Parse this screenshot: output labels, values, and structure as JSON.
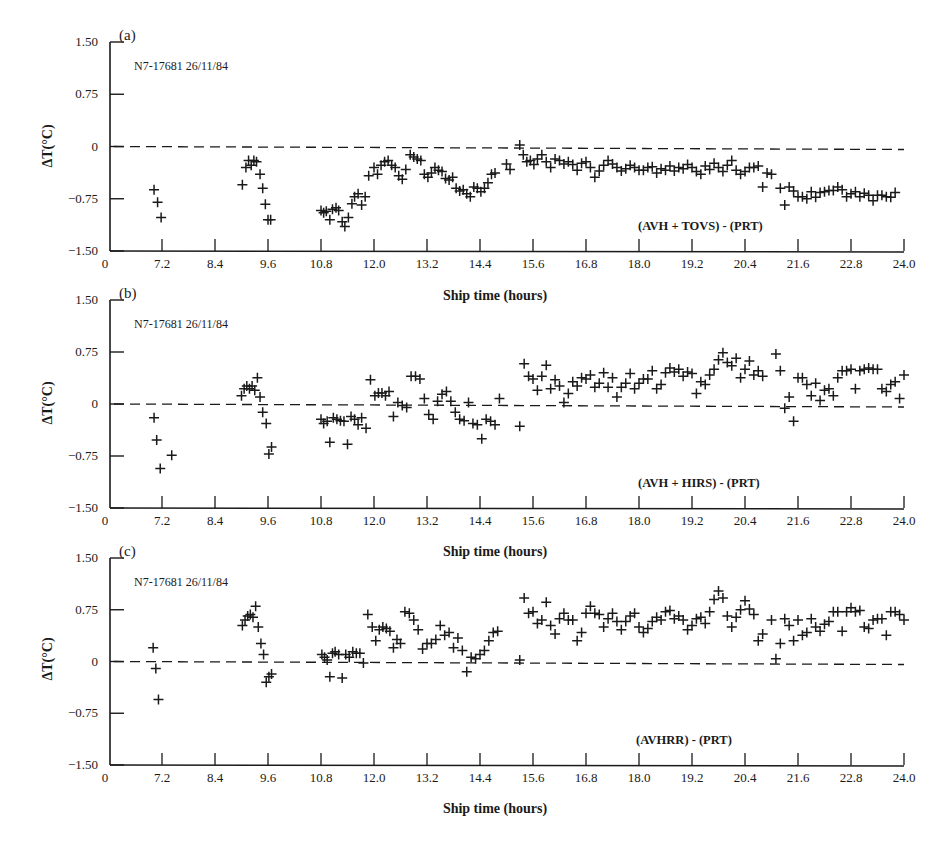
{
  "figure": {
    "xlabel": "Ship time (hours)",
    "ylabel": "ΔT(°C)",
    "x_tick_labels": [
      "0",
      "7.2",
      "8.4",
      "9.6",
      "10.8",
      "12.0",
      "13.2",
      "14.4",
      "15.6",
      "16.8",
      "18.0",
      "19.2",
      "20.4",
      "21.6",
      "22.8",
      "24.0"
    ],
    "y_tick_labels": [
      "1.50",
      "0.75",
      "0",
      "−0.75",
      "−1.50"
    ],
    "marker": "+",
    "zero_line": "dashed",
    "ink_color": "#1a1a1a"
  },
  "chart_data": [
    {
      "type": "scatter",
      "panel": "(a)",
      "run_label": "N7-17681  26/11/84",
      "series_label": "(AVH + TOVS) - (PRT)",
      "xlabel": "Ship time (hours)",
      "ylabel": "ΔT(°C)",
      "xlim": [
        6.0,
        24.0
      ],
      "ylim": [
        -1.5,
        1.5
      ],
      "x_ticks": [
        7.2,
        8.4,
        9.6,
        10.8,
        12.0,
        13.2,
        14.4,
        15.6,
        16.8,
        18.0,
        19.2,
        20.4,
        21.6,
        22.8,
        24.0
      ],
      "y_ticks": [
        1.5,
        0.75,
        0,
        -0.75,
        -1.5
      ],
      "reference_line": 0,
      "grid": false,
      "x": [
        7.02,
        7.1,
        7.18,
        9.02,
        9.1,
        9.16,
        9.22,
        9.28,
        9.34,
        9.42,
        9.48,
        9.54,
        9.6,
        9.66,
        10.8,
        10.86,
        10.92,
        11.0,
        11.06,
        11.14,
        11.2,
        11.28,
        11.34,
        11.42,
        11.5,
        11.56,
        11.64,
        11.72,
        11.8,
        11.88,
        12.0,
        12.08,
        12.16,
        12.24,
        12.32,
        12.4,
        12.48,
        12.56,
        12.64,
        12.72,
        12.82,
        12.9,
        12.98,
        13.06,
        13.14,
        13.22,
        13.3,
        13.38,
        13.46,
        13.54,
        13.62,
        13.7,
        13.78,
        13.86,
        13.94,
        14.02,
        14.1,
        14.18,
        14.26,
        14.34,
        14.42,
        14.5,
        14.58,
        14.66,
        14.74,
        15.0,
        15.08,
        15.3,
        15.38,
        15.46,
        15.54,
        15.62,
        15.7,
        15.8,
        15.9,
        16.0,
        16.1,
        16.2,
        16.3,
        16.4,
        16.5,
        16.6,
        16.7,
        16.8,
        16.9,
        17.0,
        17.1,
        17.2,
        17.3,
        17.4,
        17.5,
        17.6,
        17.7,
        17.8,
        17.9,
        18.0,
        18.1,
        18.2,
        18.3,
        18.4,
        18.5,
        18.6,
        18.7,
        18.8,
        18.9,
        19.0,
        19.1,
        19.2,
        19.3,
        19.4,
        19.5,
        19.6,
        19.7,
        19.8,
        19.9,
        20.0,
        20.1,
        20.2,
        20.3,
        20.4,
        20.5,
        20.6,
        20.7,
        20.8,
        20.9,
        21.0,
        21.2,
        21.3,
        21.4,
        21.5,
        21.6,
        21.7,
        21.8,
        21.9,
        22.0,
        22.1,
        22.2,
        22.3,
        22.4,
        22.5,
        22.6,
        22.7,
        22.8,
        22.9,
        23.0,
        23.1,
        23.2,
        23.3,
        23.4,
        23.5,
        23.6,
        23.7,
        23.8,
        23.9,
        24.0
      ],
      "y": [
        -0.62,
        -0.8,
        -1.02,
        -0.55,
        -0.3,
        -0.2,
        -0.27,
        -0.2,
        -0.22,
        -0.4,
        -0.6,
        -0.83,
        -1.05,
        -1.05,
        -0.92,
        -0.95,
        -0.93,
        -1.05,
        -0.9,
        -0.88,
        -0.92,
        -1.08,
        -1.15,
        -1.02,
        -0.82,
        -0.72,
        -0.68,
        -0.84,
        -0.72,
        -0.42,
        -0.3,
        -0.4,
        -0.27,
        -0.22,
        -0.2,
        -0.27,
        -0.3,
        -0.42,
        -0.47,
        -0.33,
        -0.12,
        -0.15,
        -0.18,
        -0.2,
        -0.4,
        -0.44,
        -0.38,
        -0.3,
        -0.34,
        -0.36,
        -0.46,
        -0.48,
        -0.44,
        -0.6,
        -0.64,
        -0.62,
        -0.68,
        -0.72,
        -0.58,
        -0.6,
        -0.65,
        -0.6,
        -0.52,
        -0.4,
        -0.38,
        -0.25,
        -0.33,
        0.02,
        -0.12,
        -0.22,
        -0.2,
        -0.26,
        -0.18,
        -0.12,
        -0.22,
        -0.3,
        -0.18,
        -0.2,
        -0.25,
        -0.22,
        -0.26,
        -0.34,
        -0.24,
        -0.22,
        -0.3,
        -0.44,
        -0.35,
        -0.27,
        -0.2,
        -0.25,
        -0.3,
        -0.35,
        -0.32,
        -0.27,
        -0.3,
        -0.34,
        -0.34,
        -0.3,
        -0.29,
        -0.38,
        -0.32,
        -0.34,
        -0.28,
        -0.35,
        -0.3,
        -0.32,
        -0.26,
        -0.3,
        -0.36,
        -0.4,
        -0.28,
        -0.33,
        -0.24,
        -0.3,
        -0.36,
        -0.27,
        -0.2,
        -0.34,
        -0.4,
        -0.36,
        -0.3,
        -0.3,
        -0.28,
        -0.58,
        -0.38,
        -0.4,
        -0.6,
        -0.84,
        -0.58,
        -0.64,
        -0.72,
        -0.72,
        -0.75,
        -0.65,
        -0.73,
        -0.66,
        -0.65,
        -0.63,
        -0.63,
        -0.58,
        -0.62,
        -0.72,
        -0.68,
        -0.65,
        -0.72,
        -0.67,
        -0.7,
        -0.78,
        -0.7,
        -0.7,
        -0.72,
        -0.73,
        -0.66
      ]
    },
    {
      "type": "scatter",
      "panel": "(b)",
      "run_label": "N7-17681  26/11/84",
      "series_label": "(AVH + HIRS) - (PRT)",
      "xlabel": "Ship time (hours)",
      "ylabel": "ΔT(°C)",
      "xlim": [
        6.0,
        24.0
      ],
      "ylim": [
        -1.5,
        1.5
      ],
      "x_ticks": [
        7.2,
        8.4,
        9.6,
        10.8,
        12.0,
        13.2,
        14.4,
        15.6,
        16.8,
        18.0,
        19.2,
        20.4,
        21.6,
        22.8,
        24.0
      ],
      "y_ticks": [
        1.5,
        0.75,
        0,
        -0.75,
        -1.5
      ],
      "reference_line": 0,
      "grid": false,
      "x": [
        7.02,
        7.08,
        7.16,
        7.42,
        9.0,
        9.06,
        9.12,
        9.18,
        9.24,
        9.3,
        9.36,
        9.42,
        9.48,
        9.56,
        9.62,
        9.68,
        10.8,
        10.86,
        10.94,
        11.0,
        11.08,
        11.16,
        11.24,
        11.32,
        11.4,
        11.48,
        11.56,
        11.64,
        11.72,
        11.82,
        11.92,
        12.02,
        12.1,
        12.18,
        12.26,
        12.34,
        12.44,
        12.54,
        12.64,
        12.74,
        12.84,
        12.94,
        13.04,
        13.14,
        13.24,
        13.34,
        13.44,
        13.54,
        13.64,
        13.74,
        13.84,
        13.94,
        14.04,
        14.14,
        14.24,
        14.34,
        14.44,
        14.54,
        14.64,
        14.74,
        14.84,
        15.3,
        15.4,
        15.5,
        15.6,
        15.7,
        15.8,
        15.9,
        16.0,
        16.1,
        16.2,
        16.3,
        16.4,
        16.5,
        16.6,
        16.7,
        16.8,
        16.9,
        17.0,
        17.1,
        17.2,
        17.3,
        17.4,
        17.5,
        17.6,
        17.7,
        17.8,
        17.9,
        18.0,
        18.1,
        18.2,
        18.3,
        18.4,
        18.5,
        18.6,
        18.7,
        18.8,
        18.9,
        19.0,
        19.1,
        19.2,
        19.3,
        19.4,
        19.5,
        19.6,
        19.7,
        19.8,
        19.9,
        20.0,
        20.1,
        20.2,
        20.3,
        20.4,
        20.5,
        20.6,
        20.7,
        20.8,
        21.1,
        21.2,
        21.3,
        21.4,
        21.5,
        21.6,
        21.7,
        21.8,
        21.9,
        22.0,
        22.1,
        22.2,
        22.3,
        22.4,
        22.5,
        22.6,
        22.7,
        22.8,
        22.9,
        23.0,
        23.1,
        23.2,
        23.3,
        23.4,
        23.5,
        23.6,
        23.7,
        23.8,
        23.9,
        24.0
      ],
      "y": [
        -0.2,
        -0.52,
        -0.93,
        -0.74,
        0.12,
        0.22,
        0.26,
        0.22,
        0.26,
        0.2,
        0.38,
        0.1,
        -0.12,
        -0.28,
        -0.72,
        -0.62,
        -0.22,
        -0.28,
        -0.25,
        -0.55,
        -0.2,
        -0.22,
        -0.24,
        -0.25,
        -0.58,
        -0.18,
        -0.22,
        -0.3,
        -0.2,
        -0.35,
        0.35,
        0.12,
        0.16,
        0.16,
        0.12,
        0.18,
        -0.18,
        0.02,
        -0.02,
        -0.05,
        0.4,
        0.4,
        0.36,
        0.08,
        -0.15,
        -0.22,
        0.04,
        0.14,
        0.18,
        0.04,
        -0.12,
        -0.22,
        -0.24,
        0.02,
        -0.28,
        -0.3,
        -0.5,
        -0.22,
        -0.25,
        -0.3,
        0.08,
        -0.32,
        0.58,
        0.4,
        0.36,
        0.2,
        0.4,
        0.56,
        0.22,
        0.35,
        0.26,
        0.02,
        0.15,
        0.32,
        0.26,
        0.38,
        0.36,
        0.42,
        0.24,
        0.3,
        0.45,
        0.24,
        0.38,
        0.1,
        0.24,
        0.3,
        0.44,
        0.22,
        0.3,
        0.36,
        0.36,
        0.48,
        0.22,
        0.28,
        0.45,
        0.52,
        0.46,
        0.5,
        0.4,
        0.46,
        0.44,
        0.15,
        0.32,
        0.28,
        0.42,
        0.5,
        0.64,
        0.74,
        0.6,
        0.55,
        0.66,
        0.38,
        0.5,
        0.62,
        0.42,
        0.48,
        0.4,
        0.72,
        0.48,
        -0.06,
        0.1,
        -0.25,
        0.38,
        0.38,
        0.28,
        0.12,
        0.3,
        0.05,
        0.2,
        0.22,
        0.12,
        0.38,
        0.48,
        0.48,
        0.5,
        0.22,
        0.48,
        0.5,
        0.52,
        0.5,
        0.5,
        0.22,
        0.18,
        0.28,
        0.32,
        0.08,
        0.42,
        0.45,
        0.36
      ]
    },
    {
      "type": "scatter",
      "panel": "(c)",
      "run_label": "N7-17681  26/11/84",
      "series_label": "(AVHRR) - (PRT)",
      "xlabel": "Ship time (hours)",
      "ylabel": "ΔT(°C)",
      "xlim": [
        6.0,
        24.0
      ],
      "ylim": [
        -1.5,
        1.5
      ],
      "x_ticks": [
        7.2,
        8.4,
        9.6,
        10.8,
        12.0,
        13.2,
        14.4,
        15.6,
        16.8,
        18.0,
        19.2,
        20.4,
        21.6,
        22.8,
        24.0
      ],
      "y_ticks": [
        1.5,
        0.75,
        0,
        -0.75,
        -1.5
      ],
      "reference_line": 0,
      "grid": false,
      "x": [
        7.0,
        7.06,
        7.12,
        9.02,
        9.08,
        9.14,
        9.2,
        9.26,
        9.32,
        9.38,
        9.44,
        9.5,
        9.56,
        9.62,
        9.68,
        10.82,
        10.88,
        10.94,
        11.0,
        11.06,
        11.12,
        11.2,
        11.28,
        11.36,
        11.44,
        11.52,
        11.6,
        11.68,
        11.76,
        11.86,
        11.96,
        12.04,
        12.12,
        12.2,
        12.28,
        12.36,
        12.44,
        12.52,
        12.6,
        12.7,
        12.8,
        12.9,
        13.0,
        13.1,
        13.2,
        13.3,
        13.4,
        13.5,
        13.6,
        13.7,
        13.8,
        13.9,
        14.0,
        14.1,
        14.2,
        14.3,
        14.4,
        14.5,
        14.6,
        14.7,
        14.8,
        15.3,
        15.4,
        15.5,
        15.6,
        15.7,
        15.8,
        15.9,
        16.0,
        16.1,
        16.2,
        16.3,
        16.4,
        16.5,
        16.6,
        16.7,
        16.8,
        16.9,
        17.0,
        17.1,
        17.2,
        17.3,
        17.4,
        17.5,
        17.6,
        17.7,
        17.8,
        17.9,
        18.0,
        18.1,
        18.2,
        18.3,
        18.4,
        18.5,
        18.6,
        18.7,
        18.8,
        18.9,
        19.0,
        19.1,
        19.2,
        19.3,
        19.4,
        19.5,
        19.6,
        19.7,
        19.8,
        19.9,
        20.0,
        20.1,
        20.2,
        20.3,
        20.4,
        20.5,
        20.6,
        20.7,
        20.8,
        21.0,
        21.1,
        21.2,
        21.3,
        21.4,
        21.5,
        21.6,
        21.7,
        21.8,
        21.9,
        22.0,
        22.1,
        22.2,
        22.3,
        22.4,
        22.5,
        22.6,
        22.7,
        22.8,
        22.9,
        23.0,
        23.1,
        23.2,
        23.3,
        23.4,
        23.5,
        23.6,
        23.7,
        23.8,
        23.9,
        24.0
      ],
      "y": [
        0.2,
        -0.1,
        -0.55,
        0.52,
        0.6,
        0.66,
        0.68,
        0.64,
        0.8,
        0.5,
        0.26,
        0.1,
        -0.3,
        -0.22,
        -0.18,
        0.1,
        0.06,
        0.02,
        -0.22,
        0.12,
        0.14,
        0.1,
        -0.24,
        0.1,
        0.06,
        0.14,
        0.12,
        0.12,
        -0.02,
        0.68,
        0.5,
        0.3,
        0.46,
        0.5,
        0.48,
        0.44,
        0.2,
        0.32,
        0.26,
        0.72,
        0.7,
        0.6,
        0.46,
        0.18,
        0.26,
        0.26,
        0.32,
        0.52,
        0.38,
        0.42,
        0.2,
        0.34,
        0.16,
        -0.15,
        0.06,
        0.04,
        0.1,
        0.16,
        0.3,
        0.42,
        0.44,
        0.02,
        0.92,
        0.7,
        0.72,
        0.55,
        0.6,
        0.86,
        0.52,
        0.4,
        0.62,
        0.7,
        0.6,
        0.6,
        0.3,
        0.42,
        0.7,
        0.8,
        0.7,
        0.68,
        0.5,
        0.62,
        0.7,
        0.58,
        0.46,
        0.58,
        0.66,
        0.7,
        0.5,
        0.42,
        0.48,
        0.58,
        0.64,
        0.6,
        0.72,
        0.74,
        0.62,
        0.66,
        0.6,
        0.46,
        0.52,
        0.62,
        0.64,
        0.55,
        0.72,
        0.9,
        1.02,
        0.92,
        0.66,
        0.5,
        0.64,
        0.75,
        0.88,
        0.76,
        0.68,
        0.3,
        0.4,
        0.6,
        0.04,
        0.26,
        0.62,
        0.52,
        0.3,
        0.6,
        0.38,
        0.42,
        0.62,
        0.5,
        0.44,
        0.54,
        0.58,
        0.72,
        0.72,
        0.44,
        0.72,
        0.78,
        0.72,
        0.74,
        0.5,
        0.48,
        0.6,
        0.62,
        0.62,
        0.38,
        0.72,
        0.72,
        0.68,
        0.6,
        0.74
      ]
    }
  ]
}
